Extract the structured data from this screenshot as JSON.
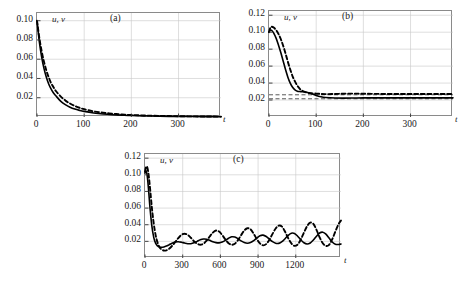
{
  "figure": {
    "axis_label_t": "t",
    "series_label": "u, v",
    "panels": [
      {
        "tag": "(a)",
        "y_ticks": [
          "0.10",
          "0.08",
          "0.06",
          "0.04",
          "0.02"
        ],
        "y_tick_values": [
          0.1,
          0.08,
          0.06,
          0.04,
          0.02
        ],
        "x_ticks": [
          "0",
          "100",
          "200",
          "300"
        ],
        "x_tick_values": [
          0,
          100,
          200,
          300
        ]
      },
      {
        "tag": "(b)",
        "y_ticks": [
          "0.12",
          "0.10",
          "0.08",
          "0.06",
          "0.04",
          "0.02"
        ],
        "y_tick_values": [
          0.12,
          0.1,
          0.08,
          0.06,
          0.04,
          0.02
        ],
        "x_ticks": [
          "0",
          "100",
          "200",
          "300"
        ],
        "x_tick_values": [
          0,
          100,
          200,
          300
        ]
      },
      {
        "tag": "(c)",
        "y_ticks": [
          "0.12",
          "0.10",
          "0.08",
          "0.06",
          "0.04",
          "0.02"
        ],
        "y_tick_values": [
          0.12,
          0.1,
          0.08,
          0.06,
          0.04,
          0.02
        ],
        "x_ticks": [
          "0",
          "300",
          "600",
          "900",
          "1200"
        ],
        "x_tick_values": [
          0,
          300,
          600,
          900,
          1200
        ]
      }
    ]
  },
  "chart_data": [
    {
      "type": "line",
      "title": "(a)",
      "xlabel": "t",
      "ylabel": "u, v",
      "xlim": [
        0,
        390
      ],
      "ylim": [
        0,
        0.108
      ],
      "grid": true,
      "legend": "none",
      "series": [
        {
          "name": "u",
          "style": "solid",
          "x": [
            0,
            5,
            10,
            15,
            20,
            25,
            30,
            35,
            40,
            50,
            60,
            70,
            80,
            90,
            100,
            120,
            140,
            160,
            180,
            200,
            240,
            280,
            320,
            360,
            390
          ],
          "y": [
            0.1,
            0.078,
            0.062,
            0.05,
            0.041,
            0.034,
            0.029,
            0.025,
            0.022,
            0.0165,
            0.0128,
            0.0102,
            0.0083,
            0.0069,
            0.0058,
            0.0042,
            0.0031,
            0.0024,
            0.0019,
            0.0015,
            0.001,
            0.0007,
            0.0005,
            0.0004,
            0.0003
          ]
        },
        {
          "name": "v",
          "style": "dashed",
          "x": [
            0,
            5,
            10,
            15,
            20,
            25,
            30,
            35,
            40,
            50,
            60,
            70,
            80,
            90,
            100,
            120,
            140,
            160,
            180,
            200,
            240,
            280,
            320,
            360,
            390
          ],
          "y": [
            0.1,
            0.082,
            0.068,
            0.057,
            0.048,
            0.041,
            0.035,
            0.031,
            0.027,
            0.0215,
            0.0172,
            0.014,
            0.0115,
            0.0096,
            0.0081,
            0.0059,
            0.0044,
            0.0034,
            0.0026,
            0.0021,
            0.0014,
            0.001,
            0.0007,
            0.0005,
            0.0004
          ]
        }
      ]
    },
    {
      "type": "line",
      "title": "(b)",
      "xlabel": "t",
      "ylabel": "u, v",
      "xlim": [
        0,
        390
      ],
      "ylim": [
        0,
        0.125
      ],
      "grid": true,
      "legend": "none",
      "asymptotes": [
        0.0215,
        0.0262
      ],
      "series": [
        {
          "name": "u",
          "style": "solid",
          "x": [
            0,
            3,
            6,
            10,
            15,
            20,
            25,
            30,
            35,
            40,
            45,
            50,
            55,
            60,
            65,
            70,
            80,
            90,
            100,
            110,
            120,
            140,
            160,
            180,
            200,
            240,
            280,
            320,
            360,
            390
          ],
          "y": [
            0.1,
            0.1025,
            0.102,
            0.099,
            0.093,
            0.085,
            0.076,
            0.066,
            0.056,
            0.047,
            0.04,
            0.035,
            0.032,
            0.0305,
            0.03,
            0.0298,
            0.0292,
            0.0275,
            0.0253,
            0.0238,
            0.023,
            0.0224,
            0.0223,
            0.0224,
            0.0225,
            0.0226,
            0.0226,
            0.0226,
            0.0226,
            0.0226
          ]
        },
        {
          "name": "v",
          "style": "dashed",
          "x": [
            0,
            3,
            6,
            10,
            15,
            20,
            25,
            30,
            35,
            40,
            45,
            50,
            55,
            60,
            65,
            70,
            80,
            90,
            100,
            110,
            120,
            140,
            160,
            180,
            200,
            240,
            280,
            320,
            360,
            390
          ],
          "y": [
            0.1,
            0.1055,
            0.1065,
            0.1055,
            0.1025,
            0.098,
            0.092,
            0.084,
            0.075,
            0.065,
            0.056,
            0.048,
            0.042,
            0.037,
            0.0335,
            0.031,
            0.0288,
            0.028,
            0.0276,
            0.0272,
            0.027,
            0.0272,
            0.0275,
            0.0276,
            0.0274,
            0.0272,
            0.0272,
            0.0272,
            0.0272,
            0.0272
          ]
        }
      ]
    },
    {
      "type": "line",
      "title": "(c)",
      "xlabel": "t",
      "ylabel": "u, v",
      "xlim": [
        0,
        1560
      ],
      "ylim": [
        0,
        0.125
      ],
      "grid": true,
      "legend": "none",
      "series": [
        {
          "name": "u",
          "style": "solid",
          "x": [
            0,
            10,
            20,
            30,
            40,
            55,
            70,
            85,
            100,
            115,
            130,
            150,
            170,
            190,
            215,
            240,
            265,
            290,
            315,
            340,
            365,
            390,
            415,
            440,
            465,
            490,
            515,
            540,
            565,
            590,
            615,
            640,
            665,
            690,
            715,
            740,
            765,
            790,
            815,
            840,
            865,
            890,
            915,
            940,
            965,
            990,
            1015,
            1040,
            1065,
            1090,
            1115,
            1140,
            1165,
            1190,
            1215,
            1240,
            1265,
            1290,
            1315,
            1340,
            1365,
            1390,
            1415,
            1440,
            1465,
            1490,
            1515,
            1540,
            1560
          ],
          "y": [
            0.102,
            0.1045,
            0.096,
            0.079,
            0.06,
            0.038,
            0.0245,
            0.0175,
            0.0145,
            0.0133,
            0.013,
            0.0133,
            0.0143,
            0.0158,
            0.0178,
            0.0192,
            0.0196,
            0.019,
            0.018,
            0.0172,
            0.0172,
            0.0182,
            0.02,
            0.0218,
            0.0228,
            0.0226,
            0.0212,
            0.0196,
            0.0185,
            0.0182,
            0.0192,
            0.0212,
            0.0238,
            0.0255,
            0.0252,
            0.0232,
            0.0206,
            0.0186,
            0.0178,
            0.0186,
            0.0208,
            0.024,
            0.0268,
            0.0275,
            0.0258,
            0.0226,
            0.0196,
            0.0177,
            0.0176,
            0.0196,
            0.0232,
            0.0272,
            0.0298,
            0.0295,
            0.0262,
            0.0218,
            0.0183,
            0.0168,
            0.018,
            0.0216,
            0.0262,
            0.03,
            0.031,
            0.0288,
            0.024,
            0.0192,
            0.0165,
            0.0162,
            0.0168
          ]
        },
        {
          "name": "v",
          "style": "dashed",
          "x": [
            0,
            10,
            20,
            30,
            40,
            55,
            70,
            85,
            100,
            115,
            130,
            150,
            170,
            190,
            215,
            240,
            265,
            290,
            315,
            340,
            365,
            390,
            415,
            440,
            465,
            490,
            515,
            540,
            565,
            590,
            615,
            640,
            665,
            690,
            715,
            740,
            765,
            790,
            815,
            840,
            865,
            890,
            915,
            940,
            965,
            990,
            1015,
            1040,
            1065,
            1090,
            1115,
            1140,
            1165,
            1190,
            1215,
            1240,
            1265,
            1290,
            1315,
            1340,
            1365,
            1390,
            1415,
            1440,
            1465,
            1490,
            1515,
            1540,
            1560
          ],
          "y": [
            0.104,
            0.11,
            0.108,
            0.0985,
            0.084,
            0.06,
            0.041,
            0.0272,
            0.0185,
            0.0132,
            0.0105,
            0.009,
            0.0092,
            0.0108,
            0.0145,
            0.019,
            0.024,
            0.0278,
            0.0292,
            0.0278,
            0.0243,
            0.0202,
            0.0172,
            0.016,
            0.0172,
            0.0208,
            0.0258,
            0.0305,
            0.033,
            0.0318,
            0.0275,
            0.0222,
            0.0178,
            0.016,
            0.0172,
            0.0215,
            0.0275,
            0.033,
            0.0358,
            0.0345,
            0.0292,
            0.0228,
            0.0175,
            0.0152,
            0.0168,
            0.022,
            0.029,
            0.0355,
            0.039,
            0.0378,
            0.0315,
            0.0238,
            0.0175,
            0.0146,
            0.0162,
            0.0222,
            0.0305,
            0.0382,
            0.0424,
            0.041,
            0.0338,
            0.0248,
            0.0178,
            0.0145,
            0.0158,
            0.0225,
            0.0318,
            0.0405,
            0.045
          ]
        }
      ]
    }
  ]
}
